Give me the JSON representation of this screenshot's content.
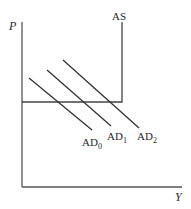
{
  "diagram": {
    "axes": {
      "y_label": "P",
      "x_label": "Y"
    },
    "curves": {
      "as": {
        "label": "AS"
      },
      "ad": [
        {
          "label": "AD",
          "subscript": "0"
        },
        {
          "label": "AD",
          "subscript": "1"
        },
        {
          "label": "AD",
          "subscript": "2"
        }
      ]
    },
    "colors": {
      "line": "#2a2a2a",
      "axis": "#555555",
      "background": "#ffffff"
    }
  }
}
